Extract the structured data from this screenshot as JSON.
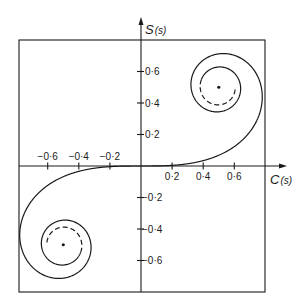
{
  "chart_data": {
    "type": "line",
    "title": "",
    "subtitle": "Cornu spiral (Euler spiral) — parametric plot of Fresnel integrals",
    "xlabel": "C(s)",
    "ylabel": "S(s)",
    "xlim": [
      -0.78,
      0.8
    ],
    "ylim": [
      -0.8,
      0.78
    ],
    "grid": false,
    "legend": null,
    "x_ticks": [
      -0.6,
      -0.4,
      -0.2,
      0.2,
      0.4,
      0.6
    ],
    "x_tick_labels": [
      "−0·6",
      "−0·4",
      "−0·2",
      "0·2",
      "0·4",
      "0·6"
    ],
    "y_ticks": [
      0.6,
      0.4,
      0.2,
      -0.2,
      -0.4,
      -0.6
    ],
    "y_tick_labels": [
      "0·6",
      "0·4",
      "0·2",
      "−0·2",
      "−0·4",
      "−0·6"
    ],
    "series": [
      {
        "name": "Cornu spiral",
        "parametric": "x = C(s) = ∫0..s cos(πt²/2) dt, y = S(s) = ∫0..s sin(πt²/2) dt",
        "s_range": [
          -2.6,
          2.6
        ],
        "dashed_tail_s": [
          2.6,
          3.0
        ]
      }
    ],
    "points": [
      {
        "name": "upper-limit-point",
        "x": 0.5,
        "y": 0.5
      },
      {
        "name": "lower-limit-point",
        "x": -0.5,
        "y": -0.5
      }
    ],
    "annotations": []
  },
  "labels": {
    "x_axis": "C",
    "x_axis_arg": "(s)",
    "y_axis": "S",
    "y_axis_arg": "(s)"
  }
}
